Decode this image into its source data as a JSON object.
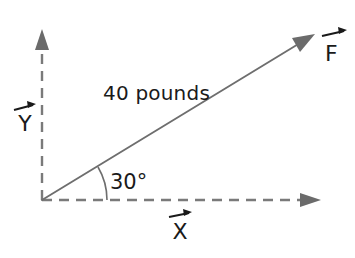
{
  "diagram": {
    "type": "force-vector-diagram",
    "background_color": "#ffffff",
    "stroke_color": "#6e6e6e",
    "text_color": "#1a1a1a",
    "origin": {
      "x": 42,
      "y": 200
    },
    "vectors": [
      {
        "id": "force",
        "label": "F",
        "label_accent": "vector-arrow-overbar",
        "magnitude_text": "40  pounds",
        "magnitude_value": 40,
        "magnitude_units": "pounds",
        "angle_text": "30°",
        "angle_value": 30,
        "angle_units": "degrees",
        "style": "solid",
        "tip": {
          "x": 313,
          "y": 36
        }
      },
      {
        "id": "x-axis",
        "label": "X",
        "label_accent": "vector-arrow-overbar",
        "style": "dashed",
        "tip": {
          "x": 320,
          "y": 200
        }
      },
      {
        "id": "y-axis",
        "label": "Y",
        "label_accent": "vector-arrow-overbar",
        "style": "dashed",
        "tip": {
          "x": 42,
          "y": 30
        }
      }
    ],
    "labels": {
      "magnitude": "40  pounds",
      "angle": "30°",
      "force_axis": "F",
      "horizontal_axis": "X",
      "vertical_axis": "Y"
    }
  }
}
